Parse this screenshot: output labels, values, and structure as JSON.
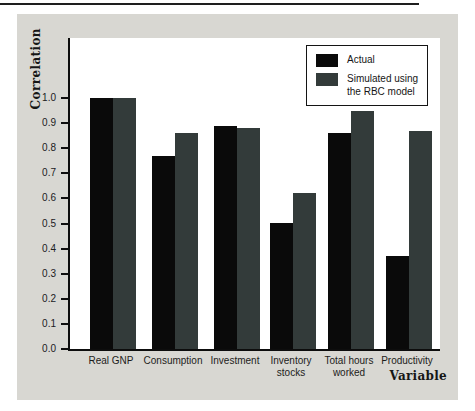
{
  "chart_data": {
    "type": "bar",
    "title": "",
    "ylabel": "Correlation",
    "xlabel": "Variable",
    "categories": [
      "Real GNP",
      "Consumption",
      "Investment",
      "Inventory stocks",
      "Total hours worked",
      "Productivity"
    ],
    "series": [
      {
        "name": "Actual",
        "color": "#0a0a0a",
        "values": [
          1.0,
          0.77,
          0.89,
          0.5,
          0.86,
          0.37
        ]
      },
      {
        "name": "Simulated using the RBC model",
        "color": "#333b3a",
        "values": [
          1.0,
          0.86,
          0.88,
          0.62,
          0.95,
          0.87
        ]
      }
    ],
    "ylim": [
      0.0,
      1.24
    ],
    "ytick_labels": [
      "0.0",
      "0.1",
      "0.2",
      "0.3",
      "0.4",
      "0.5",
      "0.6",
      "0.7",
      "0.8",
      "0.9",
      "1.0"
    ],
    "grid": false,
    "legend": {
      "position": "top-right",
      "items": [
        {
          "lines": [
            "Actual"
          ],
          "color": "#0a0a0a"
        },
        {
          "lines": [
            "Simulated using",
            "the RBC model"
          ],
          "color": "#333b3a"
        }
      ]
    },
    "colors": {
      "panel_background": "#d8d7d2",
      "plot_background": "#ffffff",
      "axis": "#0d0d0d"
    }
  }
}
